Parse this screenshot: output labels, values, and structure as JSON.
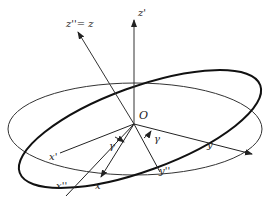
{
  "diagram": {
    "origin_label": "O",
    "axes": [
      {
        "id": "z_prime",
        "label": "z'"
      },
      {
        "id": "z_double_prime",
        "label": "z''= z"
      },
      {
        "id": "x_prime",
        "label": "x'"
      },
      {
        "id": "x_double_prime",
        "label": "x''"
      },
      {
        "id": "x",
        "label": "x"
      },
      {
        "id": "y",
        "label": "y"
      },
      {
        "id": "y_double_prime",
        "label": "y''"
      }
    ],
    "angles": [
      {
        "id": "gamma_1",
        "label": "γ"
      },
      {
        "id": "gamma_2",
        "label": "γ"
      }
    ],
    "colors": {
      "line": "#222222",
      "background": "#ffffff"
    }
  }
}
